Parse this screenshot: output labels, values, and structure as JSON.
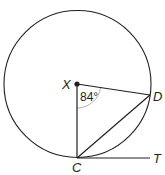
{
  "diagram": {
    "type": "circle-geometry",
    "center_label": "X",
    "points": {
      "X": {
        "label": "X",
        "x": 77,
        "y": 84
      },
      "C": {
        "label": "C",
        "x": 77,
        "y": 158
      },
      "D": {
        "label": "D",
        "x": 150,
        "y": 95
      },
      "T": {
        "label": "T",
        "x": 150,
        "y": 158
      }
    },
    "radius": 74,
    "angle_label": "84°",
    "angle_at": "X",
    "angle_between": [
      "XC",
      "XD"
    ],
    "segments": [
      "XC",
      "XD",
      "CD",
      "CT"
    ],
    "line_color": "#231f20"
  }
}
